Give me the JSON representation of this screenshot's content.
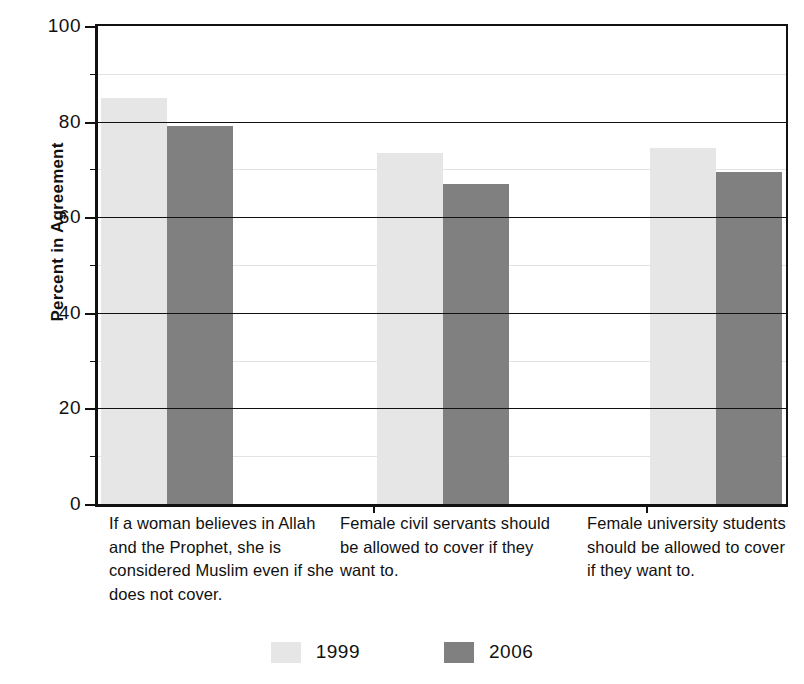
{
  "chart_data": {
    "type": "bar",
    "title": "",
    "xlabel": "",
    "ylabel": "Percent in Agreement",
    "ylim": [
      0,
      100
    ],
    "ytick_labels": [
      "0",
      "20",
      "40",
      "60",
      "80",
      "100"
    ],
    "ytick_values": [
      0,
      20,
      40,
      60,
      80,
      100
    ],
    "minor_tick_values": [
      10,
      30,
      50,
      70,
      90
    ],
    "grid": true,
    "legend_position": "bottom",
    "categories": [
      "If a woman believes in Allah and the Prophet, she is considered Muslim even if she does not cover.",
      "Female civil servants should be allowed to cover if they want to.",
      "Female university students should be allowed to cover if they want to."
    ],
    "series": [
      {
        "name": "1999",
        "color": "#e6e6e6",
        "values": [
          85,
          73.5,
          74.5
        ]
      },
      {
        "name": "2006",
        "color": "#808080",
        "values": [
          79,
          67,
          69.5
        ]
      }
    ]
  },
  "legend": {
    "items": [
      {
        "label": "1999",
        "swatch": "light-gray-swatch"
      },
      {
        "label": "2006",
        "swatch": "dark-gray-swatch"
      }
    ]
  },
  "axis": {
    "y_title": "Percent in Agreement"
  }
}
